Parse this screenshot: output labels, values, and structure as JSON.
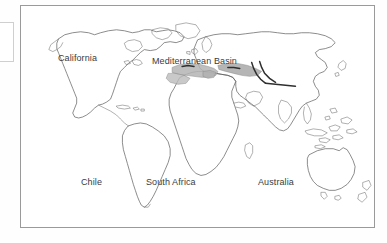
{
  "figure": {
    "type": "world-map",
    "background_color": "#ffffff",
    "frame_color": "#9a9a9a",
    "label_color": "#3b3b3b",
    "coastline_color": "#5a5a5a",
    "shading_color": "#b0b0b0",
    "highlight_color": "#2f2f2f"
  },
  "labels": [
    {
      "id": "california",
      "text": "California",
      "x": 37,
      "y": 48
    },
    {
      "id": "mediterranean-basin",
      "text": "Mediterranean Basin",
      "x": 138,
      "y": 51
    },
    {
      "id": "chile",
      "text": "Chile",
      "x": 76,
      "y": 172
    },
    {
      "id": "south-africa",
      "text": "South Africa",
      "x": 137,
      "y": 172
    },
    {
      "id": "australia",
      "text": "Australia",
      "x": 253,
      "y": 172
    }
  ],
  "regions": {
    "shaded_label": "Mediterranean Basin shading",
    "count": 5,
    "names": [
      "California",
      "Mediterranean Basin",
      "Chile",
      "South Africa",
      "Australia"
    ]
  }
}
